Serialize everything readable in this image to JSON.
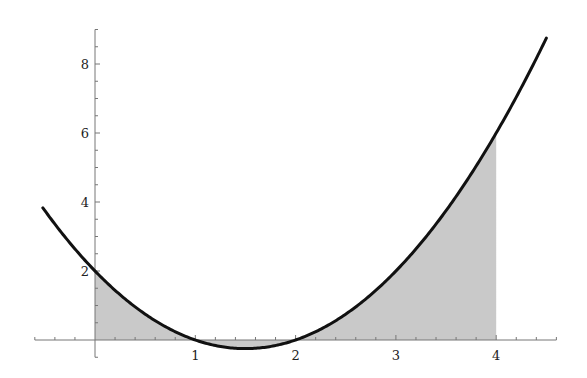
{
  "chart_data": {
    "type": "line",
    "title": "",
    "xlabel": "",
    "ylabel": "",
    "function": "f(x) = x^2 - 3x + 2",
    "x_range": [
      -0.52,
      4.5
    ],
    "xlim": [
      -0.6,
      4.6
    ],
    "ylim": [
      -0.5,
      9
    ],
    "x_ticks": [
      1,
      2,
      3,
      4
    ],
    "x_tick_labels": [
      "1",
      "2",
      "3",
      "4"
    ],
    "y_ticks": [
      2,
      4,
      6,
      8
    ],
    "y_tick_labels": [
      "2",
      "4",
      "6",
      "8"
    ],
    "x_minor_step": 0.2,
    "y_minor_step": 0.5,
    "grid": false,
    "shaded_region": {
      "from": 0,
      "to": 4,
      "description": "area between curve and x-axis"
    },
    "series": [
      {
        "name": "f(x)",
        "x": [
          -0.5,
          0,
          0.5,
          1,
          1.5,
          2,
          2.5,
          3,
          3.5,
          4,
          4.5
        ],
        "values": [
          3.75,
          2,
          0.75,
          0,
          -0.25,
          0,
          0.75,
          2,
          3.75,
          6,
          8.75
        ]
      }
    ],
    "colors": {
      "curve": "#111111",
      "fill": "#c9c9c9",
      "axis": "#777777"
    }
  }
}
